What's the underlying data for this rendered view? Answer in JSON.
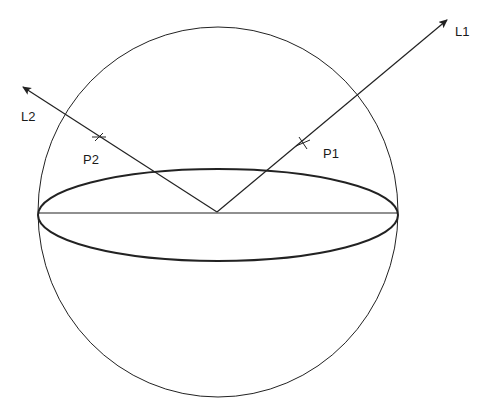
{
  "diagram": {
    "colors": {
      "background": "#ffffff",
      "stroke": "#222222"
    },
    "sphere": {
      "cx": 218,
      "cy": 212,
      "rx": 180,
      "ry": 185
    },
    "equator": {
      "cx": 218,
      "cy": 215,
      "rx": 180,
      "ry": 46
    },
    "diameter": {
      "x1": 38,
      "y1": 213,
      "x2": 398,
      "y2": 213
    },
    "center": {
      "x": 217,
      "y": 212
    },
    "lines": [
      {
        "id": "L1",
        "label": "L1",
        "tip": {
          "x": 447,
          "y": 20
        },
        "label_pos": {
          "x": 455,
          "y": 25
        }
      },
      {
        "id": "L2",
        "label": "L2",
        "tip": {
          "x": 23,
          "y": 87
        },
        "label_pos": {
          "x": 21,
          "y": 110
        }
      }
    ],
    "points": [
      {
        "id": "P1",
        "label": "P1",
        "pos": {
          "x": 303,
          "y": 143
        },
        "label_pos": {
          "x": 323,
          "y": 147
        }
      },
      {
        "id": "P2",
        "label": "P2",
        "pos": {
          "x": 99,
          "y": 137
        },
        "label_pos": {
          "x": 83,
          "y": 153
        }
      }
    ]
  }
}
